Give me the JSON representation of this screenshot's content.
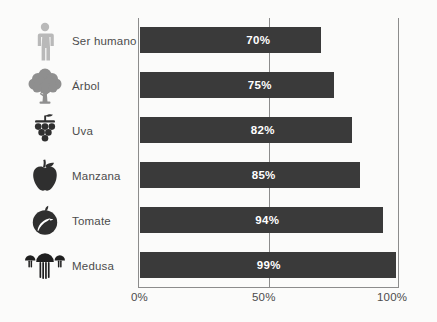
{
  "chart_data": {
    "type": "bar",
    "orientation": "horizontal",
    "title": "",
    "xlabel": "",
    "ylabel": "",
    "xlim": [
      0,
      100
    ],
    "grid": true,
    "gridlines": [
      50
    ],
    "legend": "none",
    "categories": [
      "Ser humano",
      "Árbol",
      "Uva",
      "Manzana",
      "Tomate",
      "Medusa"
    ],
    "values": [
      70,
      75,
      82,
      85,
      94,
      99
    ],
    "value_labels": [
      "70%",
      "75%",
      "82%",
      "85%",
      "94%",
      "99%"
    ],
    "tick_labels": [
      "0%",
      "50%",
      "100%"
    ],
    "tick_values": [
      0,
      50,
      100
    ],
    "bar_color": "#3a3a3a",
    "value_label_color": "#ffffff",
    "axis_color": "#8c8c8c",
    "background_color": "#fbfbfa"
  },
  "rows": [
    {
      "icon": "human-figure-icon",
      "label": "Ser humano",
      "value_label": "70%",
      "value": 70
    },
    {
      "icon": "tree-icon",
      "label": "Árbol",
      "value_label": "75%",
      "value": 75
    },
    {
      "icon": "grapes-icon",
      "label": "Uva",
      "value_label": "82%",
      "value": 82
    },
    {
      "icon": "apple-icon",
      "label": "Manzana",
      "value_label": "85%",
      "value": 85
    },
    {
      "icon": "tomato-icon",
      "label": "Tomate",
      "value_label": "94%",
      "value": 94
    },
    {
      "icon": "jellyfish-icon",
      "label": "Medusa",
      "value_label": "99%",
      "value": 99
    }
  ],
  "axis": {
    "tick_0": "0%",
    "tick_50": "50%",
    "tick_100": "100%"
  }
}
